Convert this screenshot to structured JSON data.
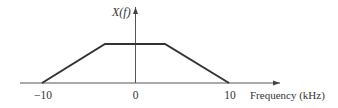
{
  "diagram": {
    "type": "spectrum-plot",
    "y_label": "X(f)",
    "x_label": "Frequency (kHz)",
    "ticks": [
      {
        "value": -10,
        "label": "−10"
      },
      {
        "value": 0,
        "label": "0"
      },
      {
        "value": 10,
        "label": "10"
      }
    ],
    "shape": "trapezoid",
    "shape_points_khz": [
      [
        -10,
        0
      ],
      [
        -3,
        1
      ],
      [
        3,
        1
      ],
      [
        10,
        0
      ]
    ],
    "line_color": "#333333",
    "axis_color": "#555555"
  }
}
